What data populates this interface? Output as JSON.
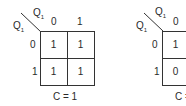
{
  "kmaps": [
    {
      "col_var": "Q",
      "col_sub": "1",
      "row_var": "Q",
      "row_sub": "1",
      "col_headers": [
        "0",
        "1"
      ],
      "row_headers": [
        "0",
        "1"
      ],
      "cells": [
        [
          "1",
          "1"
        ],
        [
          "1",
          "1"
        ]
      ],
      "caption": "C = 1"
    },
    {
      "col_var": "Q",
      "col_sub": "1",
      "row_var": "Q",
      "row_sub": "1",
      "col_headers": [
        "0",
        "1"
      ],
      "row_headers": [
        "0",
        "1"
      ],
      "cells": [
        [
          "1",
          ""
        ],
        [
          "0",
          ""
        ]
      ],
      "caption": "C = 0"
    }
  ],
  "colors": {
    "line": "#333333",
    "text": "#2a2a2a",
    "background": "#ffffff"
  }
}
